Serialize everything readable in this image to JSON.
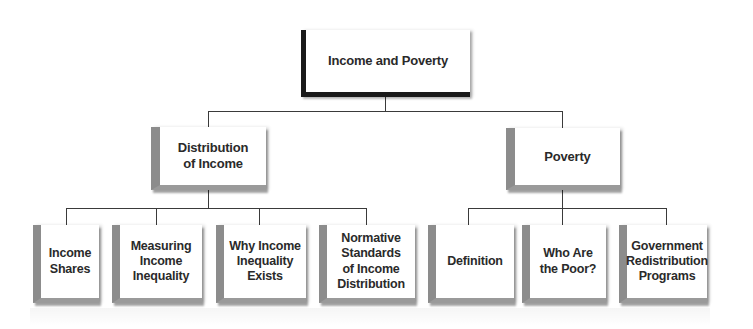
{
  "diagram": {
    "type": "hierarchy",
    "root": {
      "label": "Income and Poverty"
    },
    "branches": [
      {
        "label": "Distribution\nof Income",
        "children": [
          {
            "label": "Income\nShares"
          },
          {
            "label": "Measuring\nIncome\nInequality"
          },
          {
            "label": "Why Income\nInequality\nExists"
          },
          {
            "label": "Normative\nStandards\nof Income\nDistribution"
          }
        ]
      },
      {
        "label": "Poverty",
        "children": [
          {
            "label": "Definition"
          },
          {
            "label": "Who Are\nthe Poor?"
          },
          {
            "label": "Government\nRedistribution\nPrograms"
          }
        ]
      }
    ]
  },
  "colors": {
    "root_accent": "#1a1a1a",
    "box_accent": "#8c8c8c",
    "connector": "#3a3a3a",
    "text": "#2a2a2a",
    "background": "#ffffff"
  }
}
